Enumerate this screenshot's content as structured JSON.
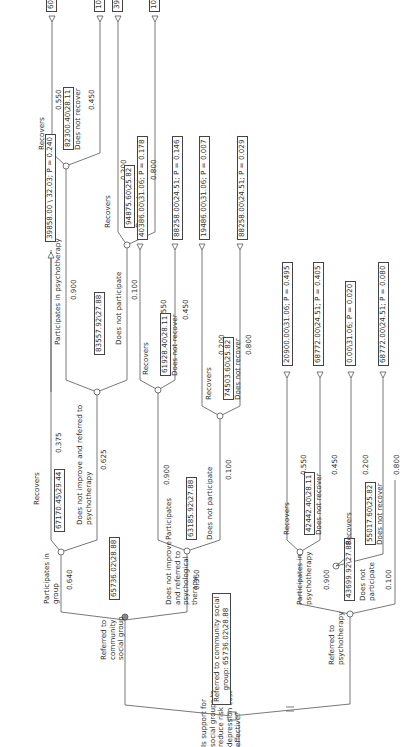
{
  "diagram": {
    "type": "decision-tree",
    "orientation": "rotated-90-ccw",
    "root": {
      "question": "Is support for social groups to reduce risk of depression cost effective?",
      "question_lines": [
        "Is support for",
        "social groups to",
        "reduce risk of",
        "depression cost",
        "effective?"
      ],
      "selected_summary_lines": [
        "Referred to community social",
        "group: 65736.02\\28.88"
      ]
    },
    "community": {
      "label_lines": [
        "Referred to",
        "community",
        "social group"
      ],
      "value": "65736.02\\28.88",
      "participates": {
        "label_lines": [
          "Participates in",
          "group"
        ],
        "prob": "0.640",
        "value": "67170.45\\29.44",
        "recovers": {
          "label": "Recovers",
          "prob": "0.375",
          "terminal": "39858.00 \\ 32.03; P = 0.240"
        },
        "not_improve": {
          "label_lines": [
            "Does not improve and referred to",
            "psychotherapy"
          ],
          "prob": "0.625",
          "value": "83557.92\\27.88",
          "participates": {
            "label": "Participates in psychotherapy",
            "prob": "0.900",
            "value": "82300.40\\28.11",
            "recovers": {
              "label": "Recovers",
              "prob": "0.550",
              "terminal": "60758.00\\31.06; P = 0.198"
            },
            "not_recover": {
              "label": "Does not recover",
              "prob": "0.450",
              "terminal": "108630.00\\24.51; P = 0.162"
            }
          },
          "not_participate": {
            "label": "Does not participate",
            "prob": "0.100",
            "value": "94875.60\\25.82",
            "recovers": {
              "label": "Recovers",
              "prob": "0.200",
              "terminal": "39858.00\\31.06; P = 0.008"
            },
            "not_recover": {
              "label": "Does not recover",
              "prob": "0.800",
              "terminal": "108630.00\\24.51; P = 0.032"
            }
          }
        }
      },
      "not_improve": {
        "label_lines": [
          "Does not improve",
          "and referred to",
          "psychological",
          "therapy"
        ],
        "prob": "0.360",
        "value": "63185.92\\27.88",
        "participates": {
          "label": "Participates",
          "prob": "0.900",
          "value": "61928.40\\28.11",
          "recovers": {
            "label": "Recovers",
            "prob": "0.550",
            "terminal": "40386.00\\31.06; P = 0.178"
          },
          "not_recover": {
            "label": "Does not recover",
            "prob": "0.450",
            "terminal": "88258.00\\24.51; P = 0.146"
          }
        },
        "not_participate": {
          "label": "Does not participate",
          "prob": "0.100",
          "value": "74503.60\\25.82",
          "recovers": {
            "label": "Recovers",
            "prob": "0.200",
            "terminal": "19486.00\\31.06; P = 0.007"
          },
          "not_recover": {
            "label": "Does not recover",
            "prob": "0.800",
            "terminal": "88258.00\\24.51; P = 0.029"
          }
        }
      }
    },
    "psychotherapy": {
      "label_lines": [
        "Referred to",
        "psychotherapy"
      ],
      "participates": {
        "label_lines": [
          "Participates in",
          "psychotherapy"
        ],
        "prob": "0.900",
        "value": "42442.40\\28.11",
        "recovers": {
          "label": "Recovers",
          "prob": "0.550",
          "terminal": "20900.00\\31.06; P = 0.495"
        },
        "not_recover": {
          "label": "Does not recover",
          "prob": "0.450",
          "terminal": "68772.00\\24.51; P = 0.405"
        }
      },
      "not_participate": {
        "label_lines": [
          "Does not",
          "participate"
        ],
        "prob": "0.100",
        "value": "55017.60\\25.82",
        "node_value": "43699.92\\27.88",
        "recovers": {
          "label": "Recovers",
          "prob": "0.200",
          "terminal": "0.00\\31.06; P = 0.020"
        },
        "not_recover": {
          "label": "Does not recover",
          "prob": "0.800",
          "terminal": "68772.00\\24.51; P = 0.080"
        }
      }
    },
    "colors": {
      "line": "#555555",
      "text": "#333333",
      "node_fill": "#ffffff",
      "chosen_node": "#888888"
    }
  }
}
